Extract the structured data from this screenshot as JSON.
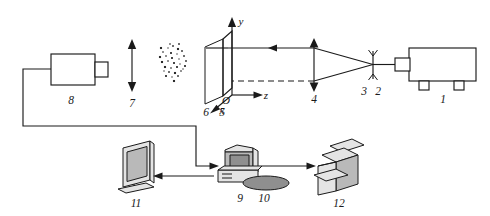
{
  "figure": {
    "background_color": "#ffffff",
    "line_color": "#1a1a1a",
    "fill_gray": "#b9b9b9"
  },
  "axes": {
    "origin_label": "O",
    "y_label": "y",
    "z_label": "z",
    "x_label": "x"
  },
  "components": [
    {
      "id": "1",
      "label": "1",
      "name": "laser"
    },
    {
      "id": "2",
      "label": "2",
      "name": "pinhole"
    },
    {
      "id": "3",
      "label": "3",
      "name": "aperture-holder"
    },
    {
      "id": "4",
      "label": "4",
      "name": "collimating-lens"
    },
    {
      "id": "5",
      "label": "5",
      "name": "light-sheet-plane"
    },
    {
      "id": "6",
      "label": "6",
      "name": "x-axis-marker"
    },
    {
      "id": "7",
      "label": "7",
      "name": "traverse-direction-arrow"
    },
    {
      "id": "8",
      "label": "8",
      "name": "ccd-camera"
    },
    {
      "id": "9",
      "label": "9",
      "name": "computer"
    },
    {
      "id": "10",
      "label": "10",
      "name": "mouse"
    },
    {
      "id": "11",
      "label": "11",
      "name": "display-monitor"
    },
    {
      "id": "12",
      "label": "12",
      "name": "printer"
    }
  ],
  "labels": {
    "laser": "1",
    "pinhole": "2",
    "aperture": "3",
    "lens": "4",
    "plane": "5",
    "xmarker": "6",
    "traverse": "7",
    "camera": "8",
    "computer": "9",
    "mouse": "10",
    "monitor": "11",
    "printer": "12"
  },
  "particle_cloud": {
    "description": "seeded particle field",
    "points": [
      [
        168,
        48
      ],
      [
        173,
        46
      ],
      [
        178,
        49
      ],
      [
        163,
        52
      ],
      [
        171,
        53
      ],
      [
        177,
        54
      ],
      [
        182,
        51
      ],
      [
        160,
        57
      ],
      [
        166,
        56
      ],
      [
        172,
        58
      ],
      [
        179,
        59
      ],
      [
        184,
        56
      ],
      [
        162,
        62
      ],
      [
        168,
        61
      ],
      [
        174,
        63
      ],
      [
        180,
        64
      ],
      [
        186,
        61
      ],
      [
        165,
        67
      ],
      [
        171,
        68
      ],
      [
        177,
        67
      ],
      [
        183,
        69
      ],
      [
        169,
        72
      ],
      [
        175,
        73
      ],
      [
        181,
        71
      ],
      [
        166,
        76
      ],
      [
        172,
        77
      ],
      [
        178,
        76
      ],
      [
        174,
        81
      ],
      [
        170,
        44
      ],
      [
        185,
        66
      ],
      [
        164,
        71
      ],
      [
        179,
        44
      ],
      [
        161,
        48
      ]
    ]
  }
}
